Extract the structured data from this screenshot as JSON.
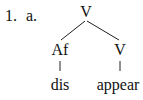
{
  "example": {
    "number": "1.",
    "sub_label": "a.",
    "tree": {
      "root": "V",
      "left_child": "Af",
      "right_child": "V",
      "left_leaf": "dis",
      "right_leaf": "appear"
    }
  }
}
